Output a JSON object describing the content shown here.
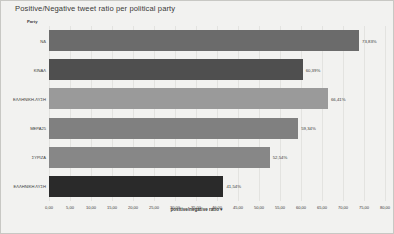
{
  "chart_data": {
    "type": "bar",
    "orientation": "horizontal",
    "title": "Positive/Negative tweet ratio per political party",
    "xlabel": "positive/negative ratio",
    "xlabel_suffix": "▼",
    "ylabel": "Party",
    "categories": [
      "ΝΔ",
      "ΚΙΝΑΛ",
      "ΕΛΛΗΝΙΚΗ ΛΥΣΗ",
      "ΜΕΡΑ25",
      "ΣΥΡΙΖΑ",
      "ΕΛΛΗΝΙΚΗ ΛΥΣΗ"
    ],
    "category_labels": [
      "ΝΔ",
      "ΚΙΝΑΛ",
      "ΕΛΛΗΝΙΚΗ-ΛΥΣΗ",
      "ΜΕΡΑ25",
      "ΣΥΡΙΖΑ",
      "ΕΛΛΗΝΙΚΗ ΛΥΣΗ"
    ],
    "values": [
      73.83,
      60.39,
      66.41,
      59.34,
      52.54,
      41.54
    ],
    "value_labels": [
      "73,83%",
      "60,39%",
      "66,41%",
      "59,34%",
      "52,54%",
      "41,54%"
    ],
    "bar_colors": [
      "#6b6b6b",
      "#4f4f4f",
      "#9a9a9a",
      "#808080",
      "#878787",
      "#2a2a2a"
    ],
    "xlim": [
      0,
      80
    ],
    "xticks": [
      0,
      5,
      10,
      15,
      20,
      25,
      30,
      35,
      40,
      45,
      50,
      55,
      60,
      65,
      70,
      75,
      80
    ],
    "xtick_labels": [
      "0,00",
      "5,00",
      "10,00",
      "15,00",
      "20,00",
      "25,00",
      "30,00",
      "35,00",
      "40,00",
      "45,00",
      "50,00",
      "55,00",
      "60,00",
      "65,00",
      "70,00",
      "75,00",
      "80,00"
    ],
    "grid": true,
    "legend": false,
    "background_color": "#f2f2f0"
  }
}
